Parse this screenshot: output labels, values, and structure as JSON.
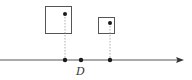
{
  "diagram": {
    "colors": {
      "stroke": "#555555",
      "dot": "#1a1a1a",
      "dotted": "#999999",
      "background": "#ffffff"
    },
    "axis": {
      "y": 60,
      "x_start": 0,
      "x_end": 184,
      "direction": "right"
    },
    "boxes": [
      {
        "name": "large-box",
        "x": 45,
        "y": 6,
        "w": 27,
        "h": 28,
        "dot": {
          "x": 65,
          "y": 14
        }
      },
      {
        "name": "small-box",
        "x": 98,
        "y": 17,
        "w": 16,
        "h": 16,
        "dot": {
          "x": 110,
          "y": 23
        }
      }
    ],
    "axis_points": [
      {
        "name": "projection-point-large",
        "x": 65
      },
      {
        "name": "point-d",
        "x": 81
      },
      {
        "name": "projection-point-small",
        "x": 110
      }
    ],
    "labels": [
      {
        "name": "label-d",
        "text": "D",
        "x": 76,
        "y": 66
      }
    ]
  }
}
